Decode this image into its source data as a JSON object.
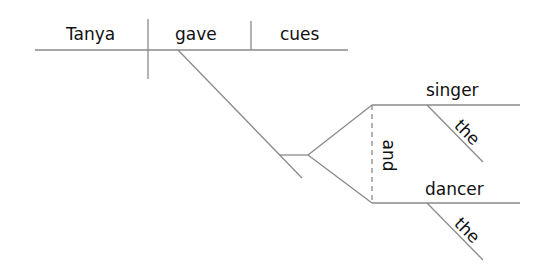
{
  "diagram": {
    "type": "sentence-diagram",
    "sentence": "Tanya gave the singer and the dancer cues",
    "subject": "Tanya",
    "verb": "gave",
    "direct_object": "cues",
    "indirect_objects": [
      {
        "word": "singer",
        "modifier": "the"
      },
      {
        "word": "dancer",
        "modifier": "the"
      }
    ],
    "conjunction": "and",
    "line_color": "#8a8a8a",
    "text_color": "#111111"
  }
}
